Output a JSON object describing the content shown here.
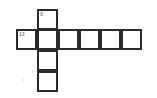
{
  "puzzle": {
    "type": "crossword",
    "cells": [
      {
        "row": 0,
        "col": 1,
        "number": "9"
      },
      {
        "row": 1,
        "col": 0,
        "number": "13"
      },
      {
        "row": 1,
        "col": 1,
        "number": ""
      },
      {
        "row": 1,
        "col": 2,
        "number": ""
      },
      {
        "row": 1,
        "col": 3,
        "number": ""
      },
      {
        "row": 1,
        "col": 4,
        "number": ""
      },
      {
        "row": 1,
        "col": 5,
        "number": ""
      },
      {
        "row": 2,
        "col": 1,
        "number": ""
      },
      {
        "row": 3,
        "col": 1,
        "number": ""
      }
    ],
    "clue_numbers": {
      "down": "9",
      "across": "13"
    }
  }
}
